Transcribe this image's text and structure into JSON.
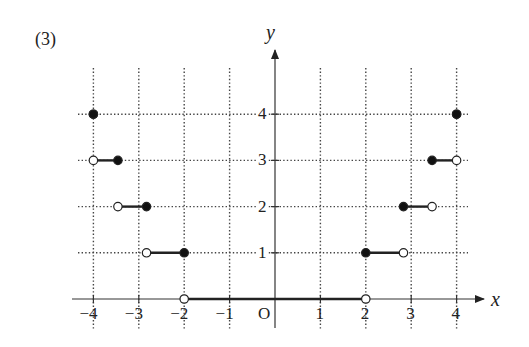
{
  "figure": {
    "label": "(3)",
    "x_axis_label": "x",
    "y_axis_label": "y",
    "origin_label": "O"
  },
  "chart_data": {
    "type": "line",
    "title": "(3)",
    "xlabel": "x",
    "ylabel": "y",
    "xlim": [
      -4,
      4
    ],
    "ylim": [
      0,
      4
    ],
    "x_ticks": [
      "-4",
      "-3",
      "-2",
      "-1",
      "1",
      "2",
      "3",
      "4"
    ],
    "y_ticks": [
      "1",
      "2",
      "3",
      "4"
    ],
    "grid": "dotted",
    "segments": [
      {
        "y": 4,
        "x_start": -4,
        "x_end": -4,
        "start": "closed",
        "end": "closed"
      },
      {
        "y": 3,
        "x_start": -4,
        "x_end": -3.46,
        "start": "open",
        "end": "closed"
      },
      {
        "y": 2,
        "x_start": -3.46,
        "x_end": -2.83,
        "start": "open",
        "end": "closed"
      },
      {
        "y": 1,
        "x_start": -2.83,
        "x_end": -2,
        "start": "open",
        "end": "closed"
      },
      {
        "y": 0,
        "x_start": -2,
        "x_end": 2,
        "start": "open",
        "end": "open"
      },
      {
        "y": 1,
        "x_start": 2,
        "x_end": 2.83,
        "start": "closed",
        "end": "open"
      },
      {
        "y": 2,
        "x_start": 2.83,
        "x_end": 3.46,
        "start": "closed",
        "end": "open"
      },
      {
        "y": 3,
        "x_start": 3.46,
        "x_end": 4,
        "start": "closed",
        "end": "open"
      },
      {
        "y": 4,
        "x_start": 4,
        "x_end": 4,
        "start": "closed",
        "end": "closed"
      }
    ]
  }
}
